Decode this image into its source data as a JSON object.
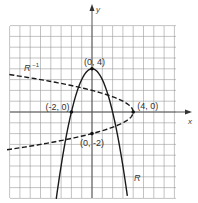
{
  "diagram": {
    "x_axis_label": "x",
    "y_axis_label": "y",
    "grid": {
      "x_min": -8,
      "x_max": 8,
      "y_min": -8,
      "y_max": 8
    },
    "curves": [
      {
        "name": "R",
        "label": "R",
        "equation": "y = 4 - x^2",
        "style": "solid"
      },
      {
        "name": "R_inverse",
        "label": "R",
        "superscript": "-1",
        "equation": "x = 4 - y^2",
        "style": "dashed"
      }
    ],
    "points": [
      {
        "label": "(0, 4)",
        "x": 0,
        "y": 4
      },
      {
        "label": "(-2, 0)",
        "x": -2,
        "y": 0
      },
      {
        "label": "(4, 0)",
        "x": 4,
        "y": 0
      },
      {
        "label": "(0, -2)",
        "x": 0,
        "y": -2
      }
    ],
    "colors": {
      "grid": "#9a9a9a",
      "curve": "#1a1a1a",
      "background": "#ffffff"
    }
  }
}
